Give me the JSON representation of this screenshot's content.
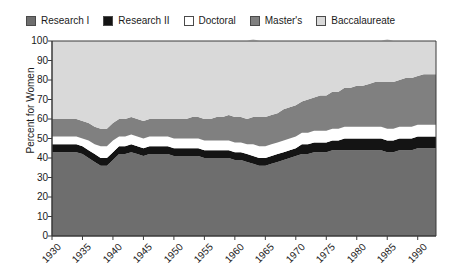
{
  "legend": {
    "position": "top",
    "items": [
      {
        "label": "Research I",
        "color": "#6e6e6e",
        "key": "research_i"
      },
      {
        "label": "Research II",
        "color": "#141414",
        "key": "research_ii"
      },
      {
        "label": "Doctoral",
        "color": "#ffffff",
        "key": "doctoral"
      },
      {
        "label": "Master's",
        "color": "#808080",
        "key": "masters"
      },
      {
        "label": "Baccalaureate",
        "color": "#d9d9d9",
        "key": "baccalaureate"
      }
    ]
  },
  "axes": {
    "ylabel": "Percent for Women",
    "yticks": [
      "0",
      "10",
      "20",
      "30",
      "40",
      "50",
      "60",
      "70",
      "80",
      "90",
      "100"
    ],
    "xticks": [
      "1930",
      "1935",
      "1940",
      "1945",
      "1950",
      "1955",
      "1960",
      "1965",
      "1970",
      "1975",
      "1980",
      "1985",
      "1990"
    ]
  },
  "colors": {
    "research_i": "#6e6e6e",
    "research_ii": "#141414",
    "doctoral": "#ffffff",
    "masters": "#808080",
    "baccalaureate": "#d9d9d9",
    "axis": "#3a3a3a",
    "text": "#1a1a1a",
    "background": "#ffffff"
  },
  "chart_data": {
    "type": "area",
    "stacked": true,
    "title": "",
    "xlabel": "",
    "ylabel": "Percent for Women",
    "ylim": [
      0,
      100
    ],
    "xlim": [
      1930,
      1993
    ],
    "grid": false,
    "legend_position": "top",
    "x": [
      1930,
      1931,
      1932,
      1933,
      1934,
      1935,
      1936,
      1937,
      1938,
      1939,
      1940,
      1941,
      1942,
      1943,
      1944,
      1945,
      1946,
      1947,
      1948,
      1949,
      1950,
      1951,
      1952,
      1953,
      1954,
      1955,
      1956,
      1957,
      1958,
      1959,
      1960,
      1961,
      1962,
      1963,
      1964,
      1965,
      1966,
      1967,
      1968,
      1969,
      1970,
      1971,
      1972,
      1973,
      1974,
      1975,
      1976,
      1977,
      1978,
      1979,
      1980,
      1981,
      1982,
      1983,
      1984,
      1985,
      1986,
      1987,
      1988,
      1989,
      1990,
      1991,
      1992,
      1993
    ],
    "series": [
      {
        "name": "Research I",
        "values": [
          43,
          43,
          43,
          43,
          43,
          42,
          40,
          38,
          36,
          36,
          39,
          42,
          42,
          43,
          42,
          41,
          42,
          42,
          42,
          42,
          41,
          41,
          41,
          41,
          41,
          40,
          40,
          40,
          40,
          40,
          39,
          39,
          38,
          37,
          36,
          36,
          37,
          38,
          39,
          40,
          41,
          42,
          42,
          43,
          43,
          43,
          44,
          44,
          44,
          44,
          44,
          44,
          44,
          44,
          44,
          43,
          43,
          44,
          44,
          44,
          45,
          45,
          45,
          45
        ]
      },
      {
        "name": "Research II",
        "values": [
          4,
          4,
          4,
          4,
          4,
          4,
          4,
          4,
          4,
          4,
          4,
          4,
          4,
          4,
          4,
          4,
          4,
          4,
          4,
          4,
          4,
          4,
          4,
          4,
          4,
          4,
          4,
          4,
          4,
          4,
          4,
          4,
          4,
          4,
          4,
          4,
          4,
          4,
          4,
          4,
          4,
          5,
          5,
          5,
          5,
          5,
          5,
          5,
          6,
          6,
          6,
          6,
          6,
          6,
          6,
          6,
          6,
          6,
          6,
          6,
          6,
          6,
          6,
          6
        ]
      },
      {
        "name": "Doctoral",
        "values": [
          4,
          4,
          4,
          4,
          4,
          4,
          5,
          5,
          6,
          6,
          6,
          5,
          5,
          5,
          5,
          5,
          5,
          5,
          5,
          5,
          5,
          5,
          5,
          5,
          5,
          5,
          5,
          5,
          5,
          5,
          5,
          5,
          5,
          6,
          6,
          6,
          6,
          6,
          6,
          6,
          6,
          6,
          6,
          6,
          6,
          6,
          6,
          6,
          6,
          6,
          6,
          6,
          6,
          6,
          6,
          6,
          6,
          6,
          6,
          6,
          6,
          6,
          6,
          6
        ]
      },
      {
        "name": "Master's",
        "values": [
          9,
          9,
          9,
          9,
          9,
          9,
          9,
          9,
          9,
          9,
          9,
          9,
          9,
          9,
          9,
          9,
          9,
          9,
          9,
          9,
          10,
          10,
          10,
          11,
          11,
          11,
          11,
          12,
          12,
          13,
          13,
          13,
          13,
          14,
          15,
          15,
          15,
          15,
          16,
          16,
          16,
          16,
          17,
          17,
          18,
          18,
          19,
          19,
          20,
          20,
          21,
          21,
          22,
          23,
          23,
          24,
          24,
          24,
          25,
          25,
          25,
          26,
          26,
          26
        ]
      },
      {
        "name": "Baccalaureate",
        "values": [
          40,
          40,
          40,
          40,
          40,
          41,
          42,
          44,
          45,
          45,
          42,
          40,
          40,
          39,
          40,
          41,
          40,
          40,
          40,
          40,
          40,
          40,
          40,
          39,
          39,
          40,
          40,
          39,
          39,
          38,
          39,
          39,
          40,
          40,
          39,
          39,
          38,
          37,
          35,
          34,
          33,
          31,
          30,
          29,
          28,
          28,
          26,
          26,
          24,
          24,
          23,
          23,
          22,
          21,
          21,
          22,
          21,
          20,
          19,
          19,
          18,
          17,
          17,
          17
        ]
      }
    ]
  }
}
